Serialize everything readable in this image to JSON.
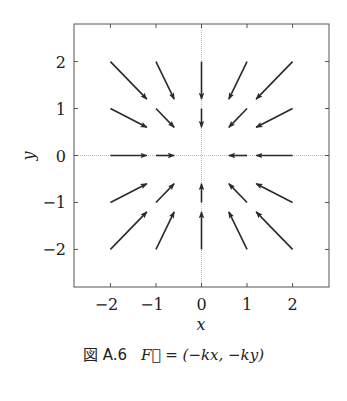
{
  "chart_data": {
    "type": "quiver",
    "title": "",
    "xlabel": "x",
    "ylabel": "y",
    "xlim": [
      -2.8,
      2.8
    ],
    "ylim": [
      -2.8,
      2.8
    ],
    "xticks": [
      -2,
      -1,
      0,
      1,
      2
    ],
    "yticks": [
      -2,
      -1,
      0,
      1,
      2
    ],
    "xtick_labels": [
      "−2",
      "−1",
      "0",
      "1",
      "2"
    ],
    "ytick_labels": [
      "−2",
      "−1",
      "0",
      "1",
      "2"
    ],
    "grid": false,
    "zero_lines": true,
    "field": "F = (-kx, -ky)",
    "arrow_scale": 0.4,
    "grid_points_x": [
      -2,
      -1,
      0,
      1,
      2
    ],
    "grid_points_y": [
      -2,
      -1,
      0,
      1,
      2
    ],
    "vectors": [
      {
        "x": -2,
        "y": 2,
        "u": 0.8,
        "v": -0.8
      },
      {
        "x": -1,
        "y": 2,
        "u": 0.4,
        "v": -0.8
      },
      {
        "x": 0,
        "y": 2,
        "u": 0,
        "v": -0.8
      },
      {
        "x": 1,
        "y": 2,
        "u": -0.4,
        "v": -0.8
      },
      {
        "x": 2,
        "y": 2,
        "u": -0.8,
        "v": -0.8
      },
      {
        "x": -2,
        "y": 1,
        "u": 0.8,
        "v": -0.4
      },
      {
        "x": -1,
        "y": 1,
        "u": 0.4,
        "v": -0.4
      },
      {
        "x": 0,
        "y": 1,
        "u": 0,
        "v": -0.4
      },
      {
        "x": 1,
        "y": 1,
        "u": -0.4,
        "v": -0.4
      },
      {
        "x": 2,
        "y": 1,
        "u": -0.8,
        "v": -0.4
      },
      {
        "x": -2,
        "y": 0,
        "u": 0.8,
        "v": 0
      },
      {
        "x": -1,
        "y": 0,
        "u": 0.4,
        "v": 0
      },
      {
        "x": 1,
        "y": 0,
        "u": -0.4,
        "v": 0
      },
      {
        "x": 2,
        "y": 0,
        "u": -0.8,
        "v": 0
      },
      {
        "x": -2,
        "y": -1,
        "u": 0.8,
        "v": 0.4
      },
      {
        "x": -1,
        "y": -1,
        "u": 0.4,
        "v": 0.4
      },
      {
        "x": 0,
        "y": -1,
        "u": 0,
        "v": 0.4
      },
      {
        "x": 1,
        "y": -1,
        "u": -0.4,
        "v": 0.4
      },
      {
        "x": 2,
        "y": -1,
        "u": -0.8,
        "v": 0.4
      },
      {
        "x": -2,
        "y": -2,
        "u": 0.8,
        "v": 0.8
      },
      {
        "x": -1,
        "y": -2,
        "u": 0.4,
        "v": 0.8
      },
      {
        "x": 0,
        "y": -2,
        "u": 0,
        "v": 0.8
      },
      {
        "x": 1,
        "y": -2,
        "u": -0.4,
        "v": 0.8
      },
      {
        "x": 2,
        "y": -2,
        "u": -0.8,
        "v": 0.8
      }
    ]
  },
  "caption": {
    "figure_label": "図 A.6",
    "formula": "F⃗ = (−kx, −ky)"
  },
  "colors": {
    "arrow": "#2a2a2a",
    "frame": "#555555",
    "zero_line": "#aaaaaa"
  }
}
